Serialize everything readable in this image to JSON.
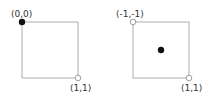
{
  "diagrams": [
    {
      "name": "top-left-origin",
      "corner_top_left_label": "(0,0)",
      "corner_bottom_right_label": "(1,1)",
      "filled_point": "top-left corner",
      "open_point": "bottom-right corner"
    },
    {
      "name": "center-origin",
      "corner_top_left_label": "(-1,-1)",
      "corner_bottom_right_label": "(1,1)",
      "filled_point": "center",
      "open_points": [
        "top-left corner",
        "bottom-right corner"
      ]
    }
  ],
  "colors": {
    "square_stroke": "#9a9a9a",
    "point_fill": "#111111",
    "label": "#333333"
  }
}
